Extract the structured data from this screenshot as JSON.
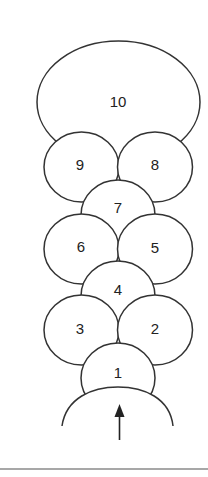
{
  "diagram": {
    "nodes": [
      {
        "id": "10",
        "label": "10",
        "shape": "ellipse",
        "row": 0
      },
      {
        "id": "9",
        "label": "9",
        "shape": "circle",
        "row": 1,
        "side": "left"
      },
      {
        "id": "8",
        "label": "8",
        "shape": "circle",
        "row": 1,
        "side": "right"
      },
      {
        "id": "7",
        "label": "7",
        "shape": "circle",
        "row": 2,
        "side": "center"
      },
      {
        "id": "6",
        "label": "6",
        "shape": "circle",
        "row": 3,
        "side": "left"
      },
      {
        "id": "5",
        "label": "5",
        "shape": "circle",
        "row": 3,
        "side": "right"
      },
      {
        "id": "4",
        "label": "4",
        "shape": "circle",
        "row": 4,
        "side": "center"
      },
      {
        "id": "3",
        "label": "3",
        "shape": "circle",
        "row": 5,
        "side": "left"
      },
      {
        "id": "2",
        "label": "2",
        "shape": "circle",
        "row": 5,
        "side": "right"
      },
      {
        "id": "1",
        "label": "1",
        "shape": "circle",
        "row": 6,
        "side": "center"
      }
    ],
    "base": {
      "shape": "arc",
      "arrow_direction": "up"
    },
    "colors": {
      "stroke": "#333333",
      "fill": "#ffffff",
      "text": "#222222",
      "rule": "#8a8a8a"
    }
  }
}
